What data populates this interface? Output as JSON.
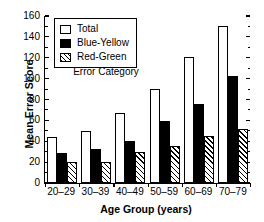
{
  "chart_data": {
    "type": "bar",
    "title": "",
    "xlabel": "Age Group (years)",
    "ylabel": "Mean Error Score",
    "categories": [
      "20–29",
      "30–39",
      "40–49",
      "50–59",
      "60–69",
      "70–79"
    ],
    "series": [
      {
        "name": "Total",
        "values": [
          44,
          50,
          67,
          90,
          120,
          150
        ]
      },
      {
        "name": "Blue-Yellow",
        "values": [
          29,
          32,
          40,
          59,
          75,
          102
        ]
      },
      {
        "name": "Red-Green",
        "values": [
          20,
          20,
          30,
          35,
          45,
          51
        ]
      }
    ],
    "ylim": [
      0,
      160
    ],
    "yticks": [
      0,
      20,
      40,
      60,
      80,
      100,
      120,
      140,
      160
    ],
    "ytick_labels": [
      "0",
      "20",
      "40",
      "60",
      "80",
      "100",
      "120",
      "140",
      "160"
    ],
    "grid": false,
    "legend_position": "upper left",
    "legend_title": "Error Category",
    "colors": {
      "total": "#ffffff",
      "blue_yellow": "#000000",
      "red_green": "#ffffff",
      "outline": "#000000",
      "background": "#ffffff"
    }
  },
  "legend": {
    "title": "Error Category",
    "items": [
      {
        "label": "Total",
        "style": "open"
      },
      {
        "label": "Blue-Yellow",
        "style": "solid-black"
      },
      {
        "label": "Red-Green",
        "style": "hatched"
      }
    ]
  },
  "axes": {
    "y_title": "Mean Error Score",
    "x_title": "Age Group (years)"
  }
}
